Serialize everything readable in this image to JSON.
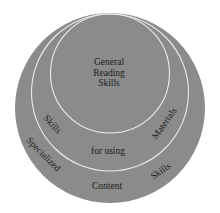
{
  "diagram": {
    "type": "nested-circles",
    "colors": {
      "fill": "#8b8b8b",
      "ring_line": "#ececec",
      "text": "#1c1c1c",
      "background": "#ffffff"
    },
    "core": {
      "lines": [
        "General",
        "Reading",
        "Skills"
      ]
    },
    "middle_ring": {
      "left_label": "Skills",
      "center_label": "for using",
      "right_label": "Materials"
    },
    "outer_ring": {
      "left_label": "Specialized",
      "bottom_label": "Content",
      "right_label": "Skills"
    }
  }
}
